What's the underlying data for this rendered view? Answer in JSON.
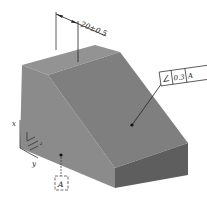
{
  "figure": {
    "type": "isometric-part-with-gdt-annotations",
    "colors": {
      "background": "#ffffff",
      "top_face": "#8f8f8f",
      "front_face": "#8a8a8a",
      "slope_face": "#7e7e7e",
      "right_face": "#5f5f5f",
      "line": "#222222"
    }
  },
  "dimension": {
    "value": "20±0.5"
  },
  "angularity_callout": {
    "symbol": "∠",
    "tolerance": "0.3",
    "datum": "A"
  },
  "datum_feature": {
    "label": "A"
  },
  "axes": {
    "x_label": "x",
    "y_label": "y",
    "z_label": "z"
  }
}
